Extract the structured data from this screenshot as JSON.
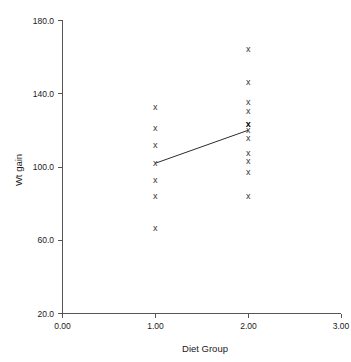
{
  "chart_data": {
    "type": "scatter",
    "title": "",
    "xlabel": "Diet Group",
    "ylabel": "Wt gain",
    "xlim": [
      0.0,
      3.0
    ],
    "ylim": [
      20.0,
      180.0
    ],
    "xticks": [
      "0.00",
      "1.00",
      "2.00",
      "3.00"
    ],
    "xtick_values": [
      0.0,
      1.0,
      2.0,
      3.0
    ],
    "yticks": [
      "20.0",
      "60.0",
      "100.0",
      "140.0",
      "180.0"
    ],
    "ytick_values": [
      20.0,
      60.0,
      100.0,
      140.0,
      180.0
    ],
    "grid": false,
    "legend": "none",
    "marker_symbol": "x",
    "series": [
      {
        "name": "Diet Group 1",
        "x": 1.0,
        "values": [
          132.5,
          121.0,
          111.7,
          101.9,
          92.6,
          83.9,
          66.4
        ]
      },
      {
        "name": "Diet Group 2",
        "x": 2.0,
        "values": [
          163.6,
          146.1,
          134.7,
          129.8,
          123.2,
          123.2,
          119.9,
          115.6,
          107.4,
          103.0,
          97.0,
          83.9
        ]
      }
    ],
    "mean_line": {
      "label": "group means connector",
      "points": [
        {
          "x": 1.0,
          "y": 101.9
        },
        {
          "x": 2.0,
          "y": 119.9
        }
      ]
    }
  },
  "axes": {
    "y_title": "Wt gain",
    "x_title": "Diet Group"
  }
}
